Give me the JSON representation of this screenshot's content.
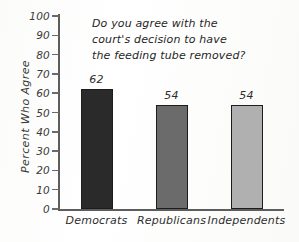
{
  "chart_data": {
    "type": "bar",
    "title": "Do you agree with the court's decision to have the feeding tube removed?",
    "title_lines": [
      "Do you agree with the",
      "court's decision to have",
      "the feeding tube removed?"
    ],
    "categories": [
      "Democrats",
      "Republicans",
      "Independents"
    ],
    "values": [
      62,
      54,
      54
    ],
    "value_labels": [
      "62",
      "54",
      "54"
    ],
    "bar_colors": [
      "#2a2a2a",
      "#6b6b6b",
      "#b0b0b0"
    ],
    "xlabel": "",
    "ylabel": "Percent Who Agree",
    "ylim": [
      0,
      100
    ],
    "ytick_step": 10,
    "ytick_labels": [
      "100",
      "90",
      "80",
      "70",
      "60",
      "50",
      "40",
      "30",
      "20",
      "10",
      "0"
    ],
    "ytick_values": [
      100,
      90,
      80,
      70,
      60,
      50,
      40,
      30,
      20,
      10,
      0
    ],
    "grid": false,
    "legend": false,
    "legend_position": "none"
  },
  "axes": {
    "y_title": "Percent Who Agree"
  },
  "colors": {
    "axis": "#5d5d5d",
    "text": "#2e2e2e",
    "background": "#fdfdfc"
  }
}
